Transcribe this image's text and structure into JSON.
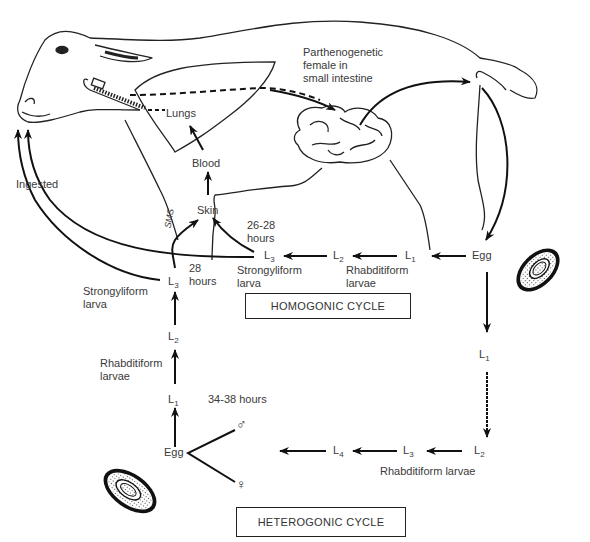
{
  "diagram": {
    "host_labels": {
      "parthenogenetic_female": [
        "Parthenogenetic",
        "female in",
        "small intestine"
      ],
      "lungs": "Lungs",
      "blood": "Blood",
      "skin": "Skin",
      "ingested": "Ingested",
      "signature": "SMS"
    },
    "homogonic": {
      "box_label": "HOMOGONIC CYCLE",
      "egg": "Egg",
      "l1": "L",
      "l1_sub": "1",
      "l2": "L",
      "l2_sub": "2",
      "l3": "L",
      "l3_sub": "3",
      "rhabditiform": [
        "Rhabditiform",
        "larvae"
      ],
      "strongyliform": [
        "Strongyliform",
        "larva"
      ],
      "time_to_skin": [
        "26-28",
        "hours"
      ]
    },
    "heterogonic": {
      "box_label": "HETEROGONIC CYCLE",
      "egg": "Egg",
      "down_l1": "L",
      "down_l1_sub": "1",
      "l2": "L",
      "l2_sub": "2",
      "l3": "L",
      "l3_sub": "3",
      "l4": "L",
      "l4_sub": "4",
      "rhabditiform_larvae": "Rhabditiform larvae",
      "male_symbol": "♂",
      "female_symbol": "♀",
      "adult_time": "34-38 hours",
      "up_l1": "L",
      "up_l1_sub": "1",
      "up_l2": "L",
      "up_l2_sub": "2",
      "up_l3": "L",
      "up_l3_sub": "3",
      "up_rhabditiform": [
        "Rhabditiform",
        "larvae"
      ],
      "up_strongyliform": [
        "Strongyliform",
        "larva"
      ],
      "time_to_skin": [
        "28",
        "hours"
      ]
    }
  }
}
